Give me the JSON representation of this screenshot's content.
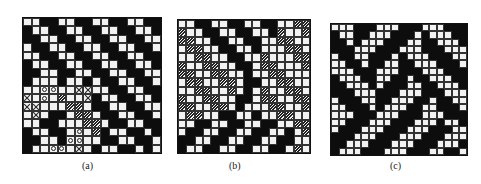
{
  "figures": [
    {
      "id": "a",
      "caption": "(a)",
      "cols": 16,
      "rows": [
        "WWBBWWBBWWBBWWBB",
        "BWWBBWWBBWWBBWWB",
        "BBWWBBWWBBWWBBWW",
        "WBBWWBBWWBBWWBBW",
        "WWBBWWBBWWBBWWBB",
        "BWWBBWWBBWWBBWWB",
        "BBWWBBWWBBWWBBWW",
        "BWWWBWWBWBBWWBBW",
        "WWOOWWXXWWBBWWBB",
        "XWOWHWWXBWWBBWWB",
        "XXWWWHHWBBWWBBWW",
        "WXWBBWHHWBBWWBBW",
        "WWBBWWWHHWBBWWBB",
        "BWWBBWOWHBWWBBWB",
        "BBWWBOOWWBBWWBBW",
        "BWWOOWXWBWWBBWBW"
      ]
    },
    {
      "id": "b",
      "caption": "(b)",
      "cols": 16,
      "rows": [
        "WWBBWWBBWWBBWWHH",
        "HWWBBWWBBWWBHWWH",
        "HHWWBBWWBBWWHHWW",
        "WHHWWBBWWBWWWHHW",
        "WWHHWWBBWWHWWWHH",
        "HWWHHWWBBWHHWWWH",
        "HHWWHHWWBWWHHWWW",
        "WHHWWHHWBBWWHHWW",
        "WWHHWWHWBWHWWHHW",
        "HWWHHWWBBWHHWWHH",
        "HHWWHHWBWWWHHWWH",
        "WHHWWBBWWBWWHHWW",
        "WWBBWWBBWWBBWWHH",
        "WBBWWBBWWBBWWBWH",
        "BBWWBBWWBBWWBBWW",
        "BWWBBWWBBWWBBWHW"
      ]
    },
    {
      "id": "c",
      "caption": "(c)",
      "cols": 18,
      "rows": [
        "WWWBBBWWWBBBWWWBBB",
        "BWWBBWWWBBBWBWWWBB",
        "BBWBWWWBBBWWBBWWWB",
        "BBBWWWBBBWWWBBBWWW",
        "WBBWWBBBWBWWWBBBWW",
        "WWBBWBBWWBBWWWBBBW",
        "WWWBBBWWWBBBWWWBBB",
        "BWWWBBWWBBWBBWWWBB",
        "BBWWWBWBBBWWBBWWWB",
        "BBBWWWBBBWWWBBBWWW",
        "WBBBWWBBWWWBBWBBWW",
        "WWBBBWBWWWBBWWBBBW",
        "WWWBBBWWWBBBWWWBBB",
        "WWBBBWWWBBBWWWBWWB",
        "WBBBWWWBBBWWWBBBWW",
        "BBBWWWBBBWWWBBBWWW",
        "BBWWWBBBWWWBBBWWWB",
        "BWWWBBBWWWBBBWWBBW"
      ]
    }
  ]
}
